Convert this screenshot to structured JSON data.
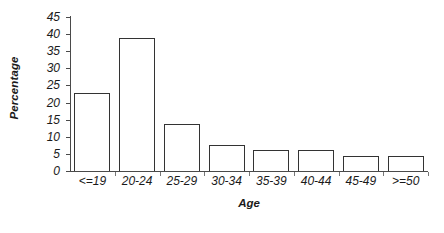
{
  "chart_data": {
    "type": "bar",
    "title": "",
    "xlabel": "Age",
    "ylabel": "Percentage",
    "categories": [
      "<=19",
      "20-24",
      "25-29",
      "30-34",
      "35-39",
      "40-44",
      "45-49",
      ">=50"
    ],
    "values": [
      22.8,
      39.0,
      13.8,
      7.5,
      6.1,
      6.2,
      4.5,
      4.5
    ],
    "ylim": [
      0,
      45
    ],
    "ytick_values": [
      0,
      5,
      10,
      15,
      20,
      25,
      30,
      35,
      40,
      45
    ],
    "ytick_labels": [
      "0",
      "5",
      "10",
      "15",
      "20",
      "25",
      "30",
      "35",
      "40",
      "45"
    ],
    "grid": false,
    "legend": "none",
    "bar_fill_color": "#ffffff",
    "bar_border_color": "#333333",
    "axis_color": "#4a4a4a",
    "text_color": "#1a1a1a"
  }
}
